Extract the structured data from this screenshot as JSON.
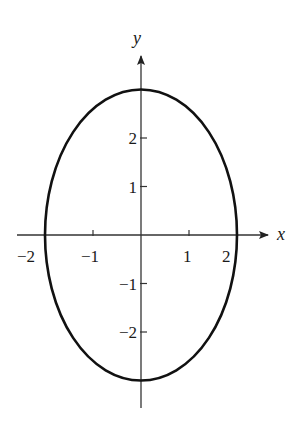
{
  "chart_data": {
    "type": "line",
    "title": "",
    "curve": {
      "shape": "ellipse",
      "center": [
        0,
        0
      ],
      "semi_axis_x": 2,
      "semi_axis_y": 3
    },
    "xlabel": "x",
    "ylabel": "y",
    "x_ticks": [
      -2,
      -1,
      1,
      2
    ],
    "x_tick_labels": [
      "−2",
      "−1",
      "1",
      "2"
    ],
    "y_ticks": [
      2,
      1,
      -1,
      -2
    ],
    "y_tick_labels": [
      "2",
      "1",
      "−1",
      "−2"
    ],
    "xlim": [
      -2.6,
      2.6
    ],
    "ylim": [
      -3.6,
      3.8
    ],
    "grid": false,
    "legend": null
  },
  "style": {
    "curve_color": "#111111",
    "axis_color": "#333333"
  }
}
